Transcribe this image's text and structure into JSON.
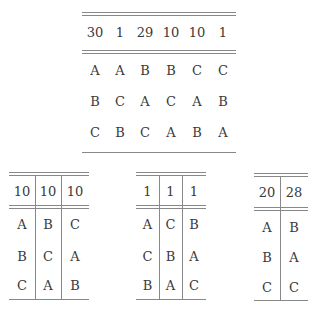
{
  "tables": [
    {
      "id": "top",
      "header": [
        "30",
        "1",
        "29",
        "10",
        "10",
        "1"
      ],
      "rows": [
        [
          "A",
          "A",
          "B",
          "B",
          "C",
          "C"
        ],
        [
          "B",
          "C",
          "A",
          "C",
          "A",
          "B"
        ],
        [
          "C",
          "B",
          "C",
          "A",
          "B",
          "A"
        ]
      ]
    },
    {
      "id": "bottom-left",
      "header": [
        "10",
        "10",
        "10"
      ],
      "rows": [
        [
          "A",
          "B",
          "C"
        ],
        [
          "B",
          "C",
          "A"
        ],
        [
          "C",
          "A",
          "B"
        ]
      ]
    },
    {
      "id": "bottom-middle",
      "header": [
        "1",
        "1",
        "1"
      ],
      "rows": [
        [
          "A",
          "C",
          "B"
        ],
        [
          "C",
          "B",
          "A"
        ],
        [
          "B",
          "A",
          "C"
        ]
      ]
    },
    {
      "id": "bottom-right",
      "header": [
        "20",
        "28"
      ],
      "rows": [
        [
          "A",
          "B"
        ],
        [
          "B",
          "A"
        ],
        [
          "C",
          "C"
        ]
      ]
    }
  ]
}
